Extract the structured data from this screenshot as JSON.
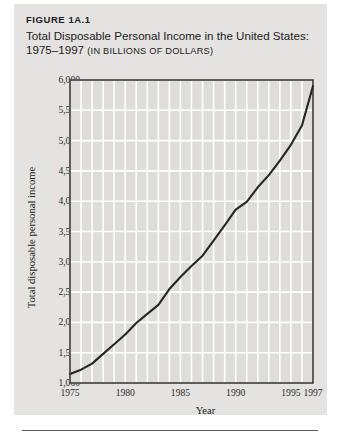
{
  "figure": {
    "number": "FIGURE 1A.1",
    "title_line1": "Total Disposable Personal Income in the United States:",
    "title_line2_years": "1975–1997 ",
    "title_line2_unit": "(IN BILLIONS OF DOLLARS)"
  },
  "colors": {
    "panel_background": "#e4e3e1",
    "plot_background": "#dedddb",
    "gridline": "#ffffff",
    "axis_line": "#2b2b2b",
    "series_line": "#262626",
    "text": "#1b1b1b",
    "rule": "#5d5d5d"
  },
  "chart_data": {
    "type": "line",
    "title": "Total Disposable Personal Income in the United States: 1975–1997 (in billions of dollars)",
    "xlabel": "Year",
    "ylabel": "Total disposable personal income",
    "xlim": [
      1975,
      1997
    ],
    "ylim": [
      1000,
      6000
    ],
    "grid": true,
    "legend": "none",
    "ytick_labels": [
      "6,000",
      "5,500",
      "5,000",
      "4,500",
      "4,000",
      "3,500",
      "3,000",
      "2,500",
      "2,000",
      "1,500",
      "1,000"
    ],
    "ytick_values": [
      6000,
      5500,
      5000,
      4500,
      4000,
      3500,
      3000,
      2500,
      2000,
      1500,
      1000
    ],
    "xtick_labels": [
      "1975",
      "1980",
      "1985",
      "1990",
      "1995",
      "1997"
    ],
    "xtick_values": [
      1975,
      1980,
      1985,
      1990,
      1995,
      1997
    ],
    "x": [
      1975,
      1976,
      1977,
      1978,
      1979,
      1980,
      1981,
      1982,
      1983,
      1984,
      1985,
      1986,
      1987,
      1988,
      1989,
      1990,
      1991,
      1992,
      1993,
      1994,
      1995,
      1996,
      1997
    ],
    "series": [
      {
        "name": "Total disposable personal income",
        "values": [
          1150,
          1220,
          1320,
          1480,
          1640,
          1800,
          1990,
          2140,
          2290,
          2550,
          2750,
          2930,
          3100,
          3350,
          3600,
          3860,
          3990,
          4230,
          4430,
          4670,
          4930,
          5250,
          5900
        ]
      }
    ]
  }
}
